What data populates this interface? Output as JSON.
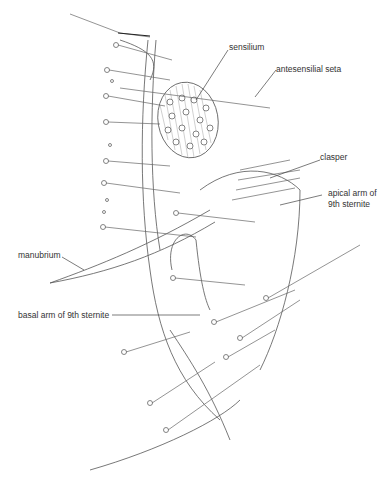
{
  "figure": {
    "labels": [
      {
        "id": "sensilium",
        "text": "sensilium"
      },
      {
        "id": "antesensilial",
        "text": "antesensilial seta"
      },
      {
        "id": "clasper",
        "text": "clasper"
      },
      {
        "id": "apical1",
        "text": "apical arm of"
      },
      {
        "id": "apical2",
        "text": "9th sternite"
      },
      {
        "id": "manubrium",
        "text": "manubrium"
      },
      {
        "id": "basal",
        "text": "basal arm of 9th sternite"
      }
    ]
  }
}
